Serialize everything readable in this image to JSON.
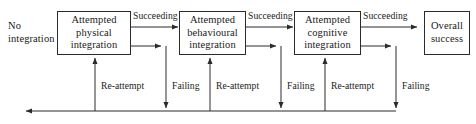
{
  "diagram": {
    "title_text_style": "serif-flowchart",
    "stroke_color": "#2b2b2b",
    "text_color": "#1a1a1a",
    "background_color": "#ffffff",
    "start_label": {
      "line1": "No",
      "line2": "integration"
    },
    "nodes": [
      {
        "id": "attempted-physical-integration",
        "line1": "Attempted",
        "line2": "physical",
        "line3": "integration"
      },
      {
        "id": "attempted-behavioural-integration",
        "line1": "Attempted",
        "line2": "behavioural",
        "line3": "integration"
      },
      {
        "id": "attempted-cognitive-integration",
        "line1": "Attempted",
        "line2": "cognitive",
        "line3": "integration"
      },
      {
        "id": "overall-success",
        "line1": "Overall",
        "line2": "success",
        "line3": ""
      }
    ],
    "succeeding_labels": [
      "Succeeding",
      "Succeeding",
      "Succeeding"
    ],
    "reattempt_labels": [
      "Re-attempt",
      "Re-attempt",
      "Re-attempt"
    ],
    "failing_labels": [
      "Failing",
      "Failing",
      "Failing"
    ]
  }
}
